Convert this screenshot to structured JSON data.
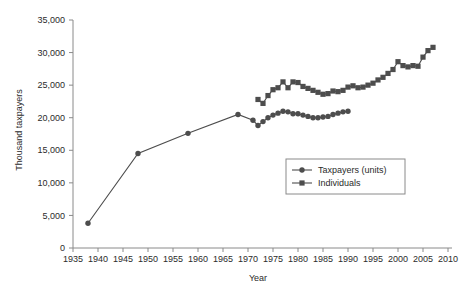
{
  "chart_data": {
    "type": "line",
    "title": "",
    "subtitle": "",
    "xlabel": "Year",
    "ylabel": "Thousand taxpayers",
    "xlim": [
      1935,
      2010
    ],
    "ylim": [
      0,
      35000
    ],
    "xticks": [
      1935,
      1940,
      1945,
      1950,
      1955,
      1960,
      1965,
      1970,
      1975,
      1980,
      1985,
      1990,
      1995,
      2000,
      2005,
      2010
    ],
    "yticks": [
      0,
      5000,
      10000,
      15000,
      20000,
      25000,
      30000,
      35000
    ],
    "xtick_labels": [
      "1935",
      "1940",
      "1945",
      "1950",
      "1955",
      "1960",
      "1965",
      "1970",
      "1975",
      "1980",
      "1985",
      "1990",
      "1995",
      "2000",
      "2005",
      "2010"
    ],
    "ytick_labels": [
      "0",
      "5,000",
      "10,000",
      "15,000",
      "20,000",
      "25,000",
      "30,000",
      "35,000"
    ],
    "grid": false,
    "legend_position": "center-right",
    "series": [
      {
        "name": "Taxpayers (units)",
        "marker": "circle",
        "color": "#4d4d4d",
        "x": [
          1938,
          1948,
          1958,
          1968,
          1971,
          1972,
          1973,
          1974,
          1975,
          1976,
          1977,
          1978,
          1979,
          1980,
          1981,
          1982,
          1983,
          1984,
          1985,
          1986,
          1987,
          1988,
          1989,
          1990
        ],
        "values": [
          3800,
          14500,
          17600,
          20500,
          19600,
          18800,
          19400,
          20000,
          20400,
          20700,
          21000,
          20900,
          20600,
          20600,
          20400,
          20200,
          20000,
          20000,
          20100,
          20200,
          20500,
          20700,
          20900,
          21000
        ]
      },
      {
        "name": "Individuals",
        "marker": "square",
        "color": "#4d4d4d",
        "x": [
          1972,
          1973,
          1974,
          1975,
          1976,
          1977,
          1978,
          1979,
          1980,
          1981,
          1982,
          1983,
          1984,
          1985,
          1986,
          1987,
          1988,
          1989,
          1990,
          1991,
          1992,
          1993,
          1994,
          1995,
          1996,
          1997,
          1998,
          1999,
          2000,
          2001,
          2002,
          2003,
          2004,
          2005,
          2006,
          2007
        ],
        "values": [
          22800,
          22200,
          23400,
          24300,
          24600,
          25500,
          24600,
          25500,
          25400,
          24800,
          24500,
          24200,
          23900,
          23600,
          23700,
          24100,
          24000,
          24200,
          24700,
          24900,
          24600,
          24700,
          25000,
          25300,
          25800,
          26200,
          26800,
          27400,
          28600,
          28000,
          27800,
          28000,
          27900,
          29300,
          30300,
          30800
        ]
      }
    ]
  },
  "legend": {
    "entries": [
      {
        "label": "Taxpayers (units)",
        "marker": "circle"
      },
      {
        "label": "Individuals",
        "marker": "square"
      }
    ]
  },
  "colors": {
    "series": "#4d4d4d",
    "axis": "#8a8a8a",
    "text": "#2b2b2b",
    "background": "#ffffff",
    "legend_border": "#8a8a8a"
  }
}
